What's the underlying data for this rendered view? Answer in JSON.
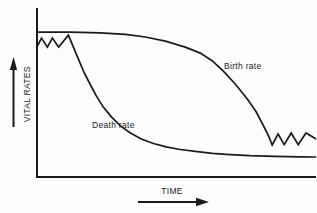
{
  "colors": {
    "ink": "#1a1a1a",
    "background": "#fdfdfd"
  },
  "chart_data": {
    "type": "line",
    "title": "",
    "xlabel": "TIME",
    "ylabel": "VITAL RATES",
    "axes": {
      "x_range": [
        0,
        100
      ],
      "y_range": [
        0,
        100
      ],
      "ticks": "none (schematic, unlabeled axes)",
      "grid": false,
      "x_arrow_annotation": "rightward arrow under TIME",
      "y_arrow_annotation": "upward arrow beside VITAL RATES"
    },
    "legend": "inline curve labels",
    "series": [
      {
        "name": "Birth rate",
        "label_position": "right of curve, upper right area",
        "shape": "high plateau, late S-shaped decline, ends fluctuating low",
        "points": [
          [
            0,
            97.3
          ],
          [
            12.1,
            97.3
          ],
          [
            22.9,
            96.8
          ],
          [
            31.8,
            95.7
          ],
          [
            38.9,
            94
          ],
          [
            46.1,
            91.3
          ],
          [
            53.2,
            87.3
          ],
          [
            58.6,
            83.3
          ],
          [
            62.9,
            78
          ],
          [
            67.1,
            70.7
          ],
          [
            71.4,
            62
          ],
          [
            75.4,
            52.7
          ],
          [
            78.6,
            44
          ],
          [
            81.4,
            34
          ],
          [
            83.2,
            27.3
          ],
          [
            84.3,
            22
          ],
          [
            86.4,
            29.3
          ],
          [
            88.6,
            22.3
          ],
          [
            91.1,
            30
          ],
          [
            93.6,
            22.3
          ],
          [
            96.4,
            30
          ],
          [
            100,
            26
          ]
        ]
      },
      {
        "name": "Death rate",
        "label_position": "left of curve, middle area",
        "shape": "starts high with zigzag fluctuation, early steep decline, flattens low",
        "points": [
          [
            0,
            86.7
          ],
          [
            1.8,
            93.3
          ],
          [
            3.9,
            87.3
          ],
          [
            5.7,
            93.3
          ],
          [
            7.9,
            87.3
          ],
          [
            11.4,
            95.3
          ],
          [
            13.2,
            87.3
          ],
          [
            15,
            79.3
          ],
          [
            17.1,
            70
          ],
          [
            19.3,
            62
          ],
          [
            21.4,
            54.7
          ],
          [
            23.9,
            47.3
          ],
          [
            26.8,
            40.7
          ],
          [
            30,
            34.7
          ],
          [
            33.6,
            30
          ],
          [
            37.5,
            26
          ],
          [
            41.8,
            23
          ],
          [
            46.4,
            20.7
          ],
          [
            51.4,
            19
          ],
          [
            56.8,
            17.7
          ],
          [
            62.9,
            16.5
          ],
          [
            69.3,
            15.6
          ],
          [
            76.4,
            14.9
          ],
          [
            85.4,
            14.4
          ],
          [
            94.3,
            14.1
          ],
          [
            100,
            14
          ]
        ]
      }
    ]
  }
}
